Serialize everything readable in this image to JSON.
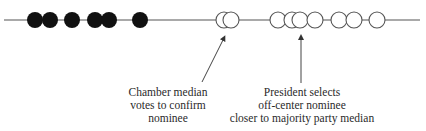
{
  "diagram": {
    "axis": {
      "x1": 4,
      "x2": 420,
      "y": 20,
      "color": "#555555"
    },
    "circle_radius": 8,
    "filled_members": [
      35,
      50,
      72,
      95,
      109,
      140
    ],
    "open_members_chamber": [
      224,
      231
    ],
    "open_members_right": [
      278,
      292,
      300,
      315,
      339,
      354,
      377
    ],
    "colors": {
      "filled": "#111111",
      "stroke": "#555555",
      "open_fill": "#ffffff",
      "text": "#2a2a2a"
    },
    "annotations": [
      {
        "id": "chamber-median",
        "lines": [
          "Chamber median",
          "votes to confirm",
          "nominee"
        ],
        "text_center_x": 168,
        "text_top": 86,
        "arrow": {
          "x1": 202,
          "y1": 82,
          "x2": 224,
          "y2": 38
        }
      },
      {
        "id": "president-selects",
        "lines": [
          "President selects",
          "off-center nominee",
          "closer to majority party median"
        ],
        "text_center_x": 302,
        "text_top": 86,
        "arrow": {
          "x1": 301,
          "y1": 83,
          "x2": 301,
          "y2": 37
        }
      }
    ]
  }
}
